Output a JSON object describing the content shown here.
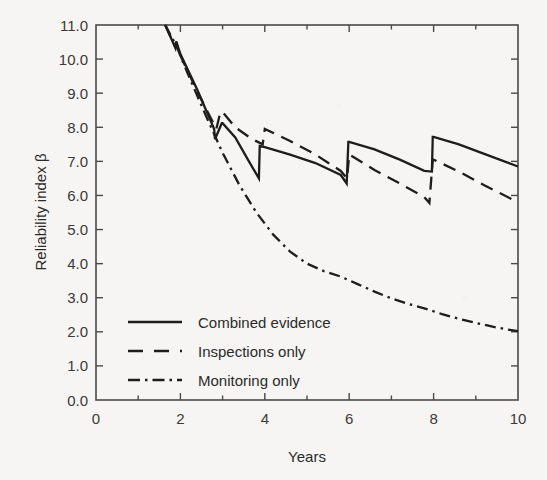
{
  "chart_data": {
    "type": "line",
    "title": "",
    "xlabel": "Years",
    "ylabel": "Reliability index β",
    "xlim": [
      0,
      10
    ],
    "ylim": [
      0,
      11
    ],
    "grid": false,
    "legend_position": "inside-lower-left",
    "x_ticks": [
      0,
      2,
      4,
      6,
      8,
      10
    ],
    "x_tick_labels": [
      "0",
      "2",
      "4",
      "6",
      "8",
      "10"
    ],
    "x_minor_ticks": [
      1,
      3,
      5,
      7,
      9
    ],
    "y_ticks": [
      0,
      1,
      2,
      3,
      4,
      5,
      6,
      7,
      8,
      9,
      10,
      11
    ],
    "y_tick_labels": [
      "0.0",
      "1.0",
      "2.0",
      "3.0",
      "4.0",
      "5.0",
      "6.0",
      "7.0",
      "8.0",
      "9.0",
      "10.0",
      "11.0"
    ],
    "line_color": "#1d1d1d",
    "series": [
      {
        "name": "Combined evidence",
        "style": "solid",
        "points": [
          [
            1.64,
            11.0
          ],
          [
            1.88,
            10.33
          ],
          [
            1.9,
            10.52
          ],
          [
            2.0,
            10.15
          ],
          [
            2.4,
            9.1
          ],
          [
            2.8,
            7.95
          ],
          [
            2.82,
            7.65
          ],
          [
            2.98,
            8.12
          ],
          [
            3.0,
            8.12
          ],
          [
            3.3,
            7.7
          ],
          [
            3.6,
            7.05
          ],
          [
            3.86,
            6.5
          ],
          [
            3.88,
            7.45
          ],
          [
            4.0,
            7.42
          ],
          [
            4.6,
            7.2
          ],
          [
            5.2,
            6.95
          ],
          [
            5.8,
            6.6
          ],
          [
            5.94,
            6.35
          ],
          [
            5.98,
            7.57
          ],
          [
            6.0,
            7.57
          ],
          [
            6.6,
            7.35
          ],
          [
            7.2,
            7.05
          ],
          [
            7.78,
            6.72
          ],
          [
            7.96,
            6.7
          ],
          [
            7.98,
            7.72
          ],
          [
            8.0,
            7.72
          ],
          [
            8.6,
            7.5
          ],
          [
            9.2,
            7.22
          ],
          [
            10.0,
            6.85
          ]
        ]
      },
      {
        "name": "Inspections only",
        "style": "dashed",
        "points": [
          [
            1.64,
            11.0
          ],
          [
            1.88,
            10.35
          ],
          [
            1.9,
            10.5
          ],
          [
            2.0,
            10.1
          ],
          [
            2.4,
            9.05
          ],
          [
            2.85,
            7.95
          ],
          [
            2.95,
            8.45
          ],
          [
            3.0,
            8.45
          ],
          [
            3.3,
            8.0
          ],
          [
            3.7,
            7.65
          ],
          [
            3.95,
            7.5
          ],
          [
            4.0,
            7.95
          ],
          [
            4.6,
            7.6
          ],
          [
            5.2,
            7.2
          ],
          [
            5.8,
            6.72
          ],
          [
            5.95,
            6.5
          ],
          [
            6.0,
            7.2
          ],
          [
            6.6,
            6.75
          ],
          [
            7.2,
            6.35
          ],
          [
            7.78,
            5.95
          ],
          [
            7.9,
            5.78
          ],
          [
            7.98,
            7.05
          ],
          [
            8.0,
            7.05
          ],
          [
            8.6,
            6.7
          ],
          [
            9.2,
            6.3
          ],
          [
            10.0,
            5.8
          ]
        ]
      },
      {
        "name": "Monitoring only",
        "style": "dash-dot",
        "points": [
          [
            1.64,
            11.0
          ],
          [
            1.9,
            10.4
          ],
          [
            2.2,
            9.5
          ],
          [
            2.6,
            8.35
          ],
          [
            3.0,
            7.25
          ],
          [
            3.4,
            6.3
          ],
          [
            3.8,
            5.5
          ],
          [
            4.2,
            4.85
          ],
          [
            4.6,
            4.35
          ],
          [
            5.0,
            4.0
          ],
          [
            5.4,
            3.78
          ],
          [
            5.8,
            3.62
          ],
          [
            6.2,
            3.4
          ],
          [
            6.6,
            3.18
          ],
          [
            7.0,
            2.98
          ],
          [
            7.4,
            2.82
          ],
          [
            7.8,
            2.68
          ],
          [
            8.2,
            2.52
          ],
          [
            8.6,
            2.38
          ],
          [
            9.0,
            2.26
          ],
          [
            9.4,
            2.15
          ],
          [
            9.7,
            2.08
          ],
          [
            10.0,
            2.02
          ]
        ]
      }
    ]
  },
  "legend": {
    "items": [
      {
        "label": "Combined evidence",
        "style": "solid"
      },
      {
        "label": "Inspections only",
        "style": "dashed"
      },
      {
        "label": "Monitoring only",
        "style": "dash-dot"
      }
    ]
  },
  "axes": {
    "x_title": "Years",
    "y_title": "Reliability index β"
  }
}
